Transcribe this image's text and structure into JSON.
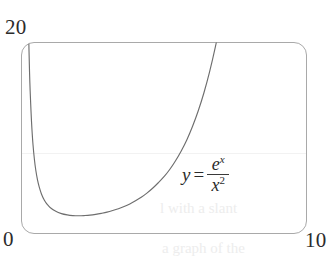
{
  "figure": {
    "kind": "function-graph",
    "background_color": "#ffffff",
    "frame_color": "#a9a9a9",
    "curve_color": "#6e6e6e",
    "text_color": "#2b2b2b"
  },
  "axes": {
    "y_max_label": "20",
    "y_min_label": "0",
    "x_max_label": "10"
  },
  "annotation": {
    "lhs": "y",
    "equals": "=",
    "numerator_base": "e",
    "numerator_exponent": "x",
    "denominator_base": "x",
    "denominator_exponent": "2",
    "plain": "y = e^x / x^2"
  },
  "artifacts": {
    "ghost_text_1": "l with a slant",
    "ghost_text_2": "a graph of the"
  },
  "chart_data": {
    "type": "line",
    "title": "",
    "xlabel": "",
    "ylabel": "",
    "xlim": [
      0,
      10
    ],
    "ylim": [
      0,
      20
    ],
    "grid": false,
    "legend": "none",
    "annotations": [
      {
        "text": "y = e^x / x^2",
        "x": 6.1,
        "y": 8.1
      }
    ],
    "series": [
      {
        "name": "y = e^x / x^2",
        "color": "#6e6e6e",
        "x": [
          0.24,
          0.26,
          0.28,
          0.3,
          0.33,
          0.36,
          0.4,
          0.45,
          0.5,
          0.56,
          0.62,
          0.7,
          0.8,
          0.9,
          1.0,
          1.2,
          1.4,
          1.6,
          1.8,
          2.0,
          2.2,
          2.4,
          2.6,
          2.8,
          3.0,
          3.2,
          3.4,
          3.6,
          3.8,
          4.0,
          4.2,
          4.4,
          4.6,
          4.8,
          5.0,
          5.2,
          5.4,
          5.6,
          5.8,
          6.0,
          6.2,
          6.4,
          6.6,
          6.8,
          7.0,
          7.2,
          7.26
        ],
        "y": [
          22.06,
          19.21,
          16.78,
          14.99,
          12.83,
          11.08,
          9.32,
          7.75,
          6.59,
          5.58,
          4.85,
          4.11,
          3.48,
          3.04,
          2.72,
          2.31,
          2.07,
          1.94,
          1.87,
          1.85,
          1.87,
          1.91,
          1.99,
          2.1,
          2.23,
          2.4,
          2.59,
          2.81,
          3.08,
          3.41,
          3.78,
          4.22,
          4.73,
          5.31,
          5.94,
          6.7,
          7.59,
          8.62,
          9.8,
          11.21,
          12.83,
          14.72,
          16.93,
          19.5,
          22.38,
          25.7,
          26.75
        ],
        "minimum_point": {
          "x": 2.0,
          "y": 1.85
        },
        "vertical_asymptote": 0,
        "notes": "curve enters top of frame near x=0.24 and exits top of frame near x=7.26"
      }
    ]
  }
}
